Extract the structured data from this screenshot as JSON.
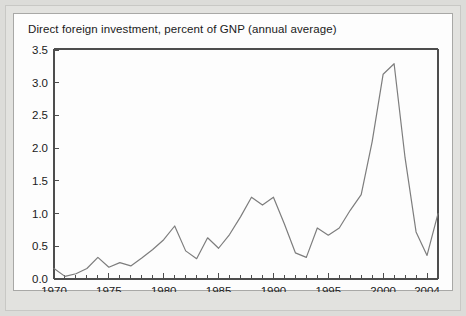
{
  "figure": {
    "background_color": "#dcdcd9",
    "panel_color": "#fdfdfd",
    "panel_border_color": "#a8a8a6",
    "line_color": "#7d7d7d",
    "axis_color": "#4d4d4d"
  },
  "chart_data": {
    "type": "line",
    "title": "Direct foreign investment, percent of GNP (annual average)",
    "xlabel": "",
    "ylabel": "",
    "grid": false,
    "legend": "none",
    "xlim": [
      1970,
      2005
    ],
    "ylim": [
      0.0,
      3.5
    ],
    "yticks": [
      0.0,
      0.5,
      1.0,
      1.5,
      2.0,
      2.5,
      3.0,
      3.5
    ],
    "ytick_labels": [
      "0.0",
      "0.5",
      "1.0",
      "1.5",
      "2.0",
      "2.5",
      "3.0",
      "3.5"
    ],
    "xticks": [
      1970,
      1975,
      1980,
      1985,
      1990,
      1995,
      2000,
      2004
    ],
    "xtick_labels": [
      "1970",
      "1975",
      "1980",
      "1985",
      "1990",
      "1995",
      "2000",
      "2004"
    ],
    "x_minor_tick_interval": 1,
    "x": [
      1970,
      1971,
      1972,
      1973,
      1974,
      1975,
      1976,
      1977,
      1978,
      1979,
      1980,
      1981,
      1982,
      1983,
      1984,
      1985,
      1986,
      1987,
      1988,
      1989,
      1990,
      1991,
      1992,
      1993,
      1994,
      1995,
      1996,
      1997,
      1998,
      1999,
      2000,
      2001,
      2002,
      2003,
      2004,
      2005
    ],
    "values": [
      0.16,
      0.04,
      0.08,
      0.16,
      0.33,
      0.18,
      0.25,
      0.2,
      0.32,
      0.45,
      0.6,
      0.81,
      0.43,
      0.31,
      0.63,
      0.47,
      0.68,
      0.95,
      1.25,
      1.13,
      1.25,
      0.84,
      0.4,
      0.33,
      0.78,
      0.67,
      0.78,
      1.05,
      1.29,
      2.1,
      3.13,
      3.29,
      1.85,
      0.72,
      0.36,
      1.0
    ],
    "series_name": "Direct foreign investment, percent of GNP"
  }
}
